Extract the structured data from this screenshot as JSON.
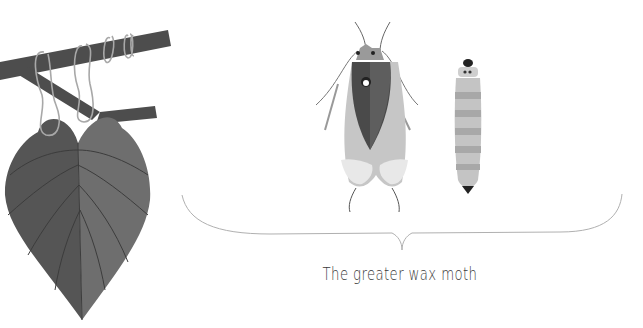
{
  "caption": "The greater wax moth",
  "illustration": {
    "left": "leaf-on-branch-with-tendrils",
    "center": "adult-moth",
    "right": "larva",
    "bracket": "curly-brace-under-insects"
  },
  "colors": {
    "branch": "#4d4d4d",
    "leaf_left": "#5a5a5a",
    "leaf_right": "#6e6e6e",
    "tendril": "#a8a8a8",
    "moth_wing": "#c4c4c4",
    "moth_body": "#4a4a4a",
    "larva": "#bdbdbd",
    "larva_band": "#a5a5a5",
    "bracket": "#b0b0b0",
    "caption": "#3a3a3a"
  }
}
